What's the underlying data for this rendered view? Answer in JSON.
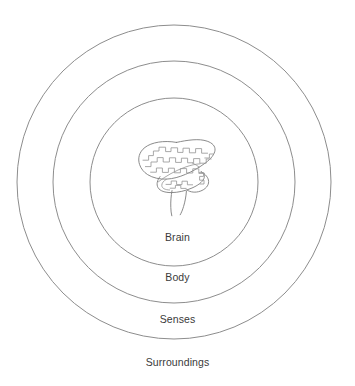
{
  "diagram": {
    "type": "concentric-rings",
    "background_color": "#ffffff",
    "stroke_color": "#8d8d8d",
    "label_color": "#3a3a3a",
    "center": {
      "x": 174,
      "y": 182
    },
    "rings": [
      {
        "id": "brain",
        "label": "Brain",
        "radius": 84,
        "level": 1,
        "has_circle": true,
        "label_position": "inside-bottom"
      },
      {
        "id": "body",
        "label": "Body",
        "radius": 121,
        "level": 2,
        "has_circle": true,
        "label_position": "inside-bottom"
      },
      {
        "id": "senses",
        "label": "Senses",
        "radius": 157,
        "level": 3,
        "has_circle": true,
        "label_position": "inside-bottom"
      },
      {
        "id": "surroundings",
        "label": "Surroundings",
        "radius": 0,
        "level": 4,
        "has_circle": false,
        "label_position": "outside-bottom"
      }
    ],
    "illustration": {
      "name": "brain-illustration",
      "description": "Line drawing of a human brain with cerebrum, cerebellum and brain stem",
      "stroke_color": "#7d7d7d"
    }
  }
}
